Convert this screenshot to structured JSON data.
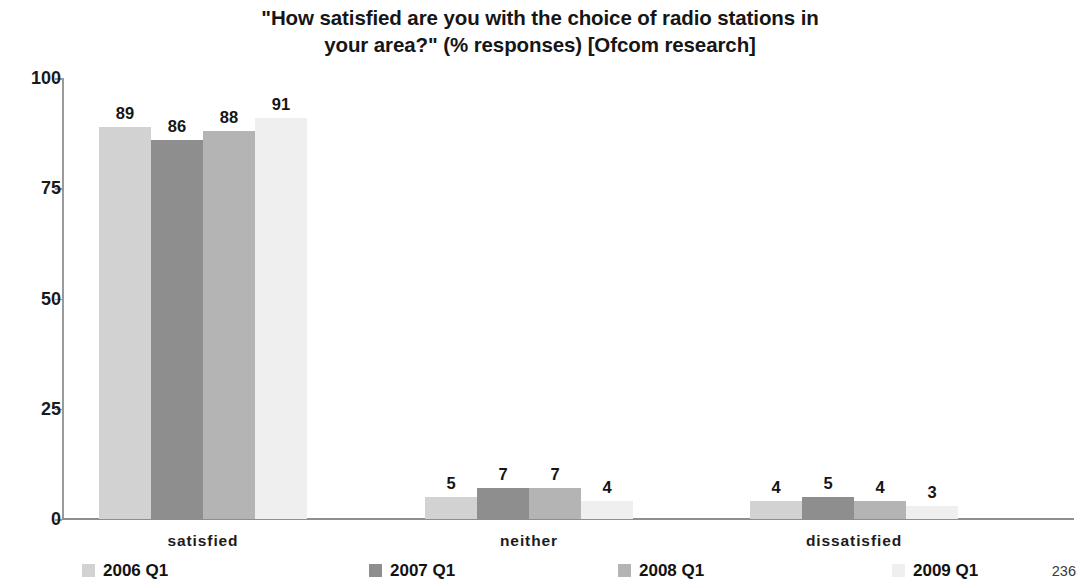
{
  "chart_data": {
    "type": "bar",
    "title": "\"How satisfied are you with the choice of radio stations in your area?\" (% responses) [Ofcom research]",
    "title_line1": "\"How satisfied are you with the choice of radio stations in",
    "title_line2": "your area?\" (% responses) [Ofcom research]",
    "xlabel": "",
    "ylabel": "",
    "ylim": [
      0,
      100
    ],
    "yticks": [
      0,
      25,
      50,
      75,
      100
    ],
    "ytick_labels": [
      "0",
      "25",
      "50",
      "75",
      "100"
    ],
    "grid": false,
    "legend_position": "bottom",
    "categories": [
      "satisfied",
      "neither",
      "dissatisfied"
    ],
    "series": [
      {
        "name": "2006 Q1",
        "color": "#d2d2d2",
        "values": [
          89,
          5,
          4
        ]
      },
      {
        "name": "2007 Q1",
        "color": "#8e8e8e",
        "values": [
          86,
          7,
          5
        ]
      },
      {
        "name": "2008 Q1",
        "color": "#b4b4b4",
        "values": [
          88,
          7,
          4
        ]
      },
      {
        "name": "2009 Q1",
        "color": "#efefef",
        "values": [
          91,
          4,
          3
        ]
      }
    ],
    "data_labels": [
      [
        "89",
        "86",
        "88",
        "91"
      ],
      [
        "5",
        "7",
        "7",
        "4"
      ],
      [
        "4",
        "5",
        "4",
        "3"
      ]
    ]
  },
  "footer": {
    "page_number": "236"
  }
}
